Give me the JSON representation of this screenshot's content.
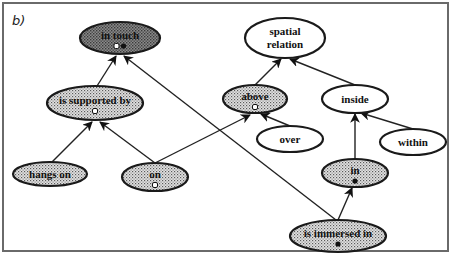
{
  "panel_label": "b)",
  "colors": {
    "dark_fill": "#6e6e6e",
    "stipple_fill": "#c4c4c4",
    "white_fill": "#ffffff",
    "stroke": "#1a1a1a"
  },
  "nodes": [
    {
      "id": "in_touch",
      "label": "in touch",
      "cx": 120,
      "cy": 38,
      "rx": 40,
      "ry": 16,
      "fill": "dark",
      "markers": [
        "open",
        "filled"
      ]
    },
    {
      "id": "is_supported_by",
      "label": "is supported by",
      "cx": 95,
      "cy": 103,
      "rx": 48,
      "ry": 17,
      "fill": "stipple",
      "markers": [
        "open"
      ]
    },
    {
      "id": "hangs_on",
      "label": "hangs on",
      "cx": 50,
      "cy": 174,
      "rx": 37,
      "ry": 12,
      "fill": "stipple",
      "markers": []
    },
    {
      "id": "on",
      "label": "on",
      "cx": 155,
      "cy": 177,
      "rx": 33,
      "ry": 14,
      "fill": "stipple",
      "markers": [
        "open"
      ]
    },
    {
      "id": "spatial_relation",
      "label_lines": [
        "spatial",
        "relation"
      ],
      "cx": 285,
      "cy": 38,
      "rx": 40,
      "ry": 20,
      "fill": "white",
      "markers": []
    },
    {
      "id": "above",
      "label": "above",
      "cx": 255,
      "cy": 99,
      "rx": 32,
      "ry": 14,
      "fill": "stipple",
      "markers": [
        "open"
      ]
    },
    {
      "id": "inside",
      "label": "inside",
      "cx": 355,
      "cy": 99,
      "rx": 33,
      "ry": 14,
      "fill": "white",
      "markers": []
    },
    {
      "id": "over",
      "label": "over",
      "cx": 290,
      "cy": 139,
      "rx": 33,
      "ry": 13,
      "fill": "white",
      "markers": []
    },
    {
      "id": "within",
      "label": "within",
      "cx": 413,
      "cy": 142,
      "rx": 33,
      "ry": 13,
      "fill": "white",
      "markers": []
    },
    {
      "id": "in",
      "label": "in",
      "cx": 355,
      "cy": 173,
      "rx": 33,
      "ry": 14,
      "fill": "stipple",
      "markers": [
        "filled"
      ]
    },
    {
      "id": "is_immersed_in",
      "label": "is immersed in",
      "cx": 338,
      "cy": 236,
      "rx": 48,
      "ry": 16,
      "fill": "stipple",
      "markers": [
        "filled"
      ]
    }
  ],
  "edges": [
    {
      "from": "is_supported_by",
      "to": "in_touch",
      "x1": 97,
      "y1": 86,
      "x2": 116,
      "y2": 56
    },
    {
      "from": "is_immersed_in",
      "to": "in_touch",
      "x1": 336,
      "y1": 220,
      "x2": 124,
      "y2": 56
    },
    {
      "from": "hangs_on",
      "to": "is_supported_by",
      "x1": 52,
      "y1": 162,
      "x2": 92,
      "y2": 122
    },
    {
      "from": "on",
      "to": "is_supported_by",
      "x1": 155,
      "y1": 163,
      "x2": 100,
      "y2": 122
    },
    {
      "from": "on",
      "to": "above",
      "x1": 155,
      "y1": 163,
      "x2": 250,
      "y2": 115
    },
    {
      "from": "above",
      "to": "spatial_relation",
      "x1": 255,
      "y1": 85,
      "x2": 281,
      "y2": 59
    },
    {
      "from": "inside",
      "to": "spatial_relation",
      "x1": 355,
      "y1": 85,
      "x2": 290,
      "y2": 59
    },
    {
      "from": "over",
      "to": "above",
      "x1": 290,
      "y1": 126,
      "x2": 261,
      "y2": 114
    },
    {
      "from": "within",
      "to": "inside",
      "x1": 413,
      "y1": 129,
      "x2": 361,
      "y2": 113
    },
    {
      "from": "in",
      "to": "inside",
      "x1": 355,
      "y1": 159,
      "x2": 355,
      "y2": 114
    },
    {
      "from": "is_immersed_in",
      "to": "in",
      "x1": 338,
      "y1": 220,
      "x2": 352,
      "y2": 188
    }
  ]
}
